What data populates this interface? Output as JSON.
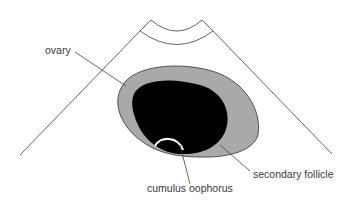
{
  "diagram": {
    "labels": {
      "ovary": "ovary",
      "secondary_follicle": "secondary follicle",
      "cumulus_oophorus": "cumulus oophorus"
    },
    "colors": {
      "ovary_fill": "#a9a9a9",
      "follicle_fill": "#000000",
      "cumulus_stroke": "#ffffff",
      "line": "#555555",
      "text": "#3a3a3a"
    }
  }
}
